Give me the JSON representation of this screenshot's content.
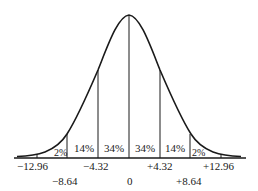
{
  "diagram": {
    "type": "normal-distribution-curve",
    "regions": [
      {
        "label": "2%",
        "from": "-12.96",
        "to": "-8.64"
      },
      {
        "label": "14%",
        "from": "-8.64",
        "to": "-4.32"
      },
      {
        "label": "34%",
        "from": "-4.32",
        "to": "0"
      },
      {
        "label": "34%",
        "from": "0",
        "to": "+4.32"
      },
      {
        "label": "14%",
        "from": "+4.32",
        "to": "+8.64"
      },
      {
        "label": "2%",
        "from": "+8.64",
        "to": "+12.96"
      }
    ],
    "axis_labels_upper": [
      "−12.96",
      "−4.32",
      "+4.32",
      "+12.96"
    ],
    "axis_labels_lower": [
      "−8.64",
      "0",
      "+8.64"
    ],
    "colors": {
      "line": "#1a1a1a",
      "background": "#ffffff"
    }
  }
}
